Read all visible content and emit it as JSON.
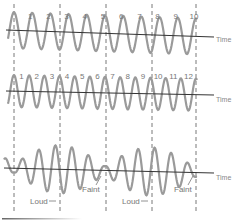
{
  "colors": {
    "wave": "#9a9a9a",
    "axis": "#333333",
    "dashed": "#555555",
    "label": "#777777"
  },
  "axis_label": "Time",
  "dashed_lines_x": [
    14,
    60,
    106,
    152,
    196
  ],
  "rows": [
    {
      "name": "wave-a",
      "axis_y": 33,
      "cycles": 10,
      "amplitude": 18,
      "phase": "start-high",
      "cycle_labels": [
        "1",
        "2",
        "3",
        "4",
        "5",
        "6",
        "7",
        "8",
        "9",
        "10"
      ]
    },
    {
      "name": "wave-b",
      "axis_y": 92,
      "cycles": 12,
      "amplitude": 16,
      "cycle_labels": [
        "1",
        "2",
        "3",
        "4",
        "5",
        "6",
        "7",
        "8",
        "9",
        "10",
        "11",
        "12"
      ]
    },
    {
      "name": "beat-wave",
      "axis_y": 170,
      "annotations": [
        {
          "text": "Loud",
          "x": 32,
          "y": 204
        },
        {
          "text": "Faint",
          "x": 82,
          "y": 192
        },
        {
          "text": "Loud",
          "x": 122,
          "y": 204
        },
        {
          "text": "Faint",
          "x": 174,
          "y": 192
        }
      ]
    }
  ]
}
